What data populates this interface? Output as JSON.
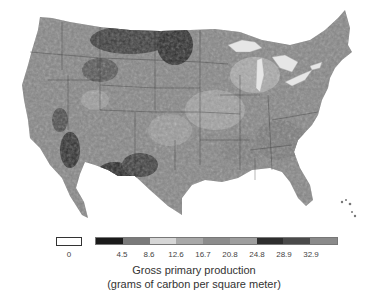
{
  "map": {
    "subject": "Contiguous United States",
    "style": "grayscale",
    "features": [
      "state boundaries",
      "Great Lakes",
      "Florida peninsula",
      "Bahamas islands",
      "Baja California"
    ]
  },
  "legend": {
    "zero_label": "0",
    "ticks": [
      "4.5",
      "8.6",
      "12.6",
      "16.7",
      "20.8",
      "24.8",
      "28.9",
      "32.9"
    ],
    "colors": [
      "#1a1a1a",
      "#7a7a7a",
      "#d6d6d6",
      "#a8a8a8",
      "#8c8c8c",
      "#9e9e9e",
      "#2e2e2e",
      "#4a4a4a",
      "#8a8a8a"
    ],
    "zero_color": "#ffffff",
    "title": "Gross primary production",
    "subtitle": "(grams of carbon per square meter)"
  }
}
